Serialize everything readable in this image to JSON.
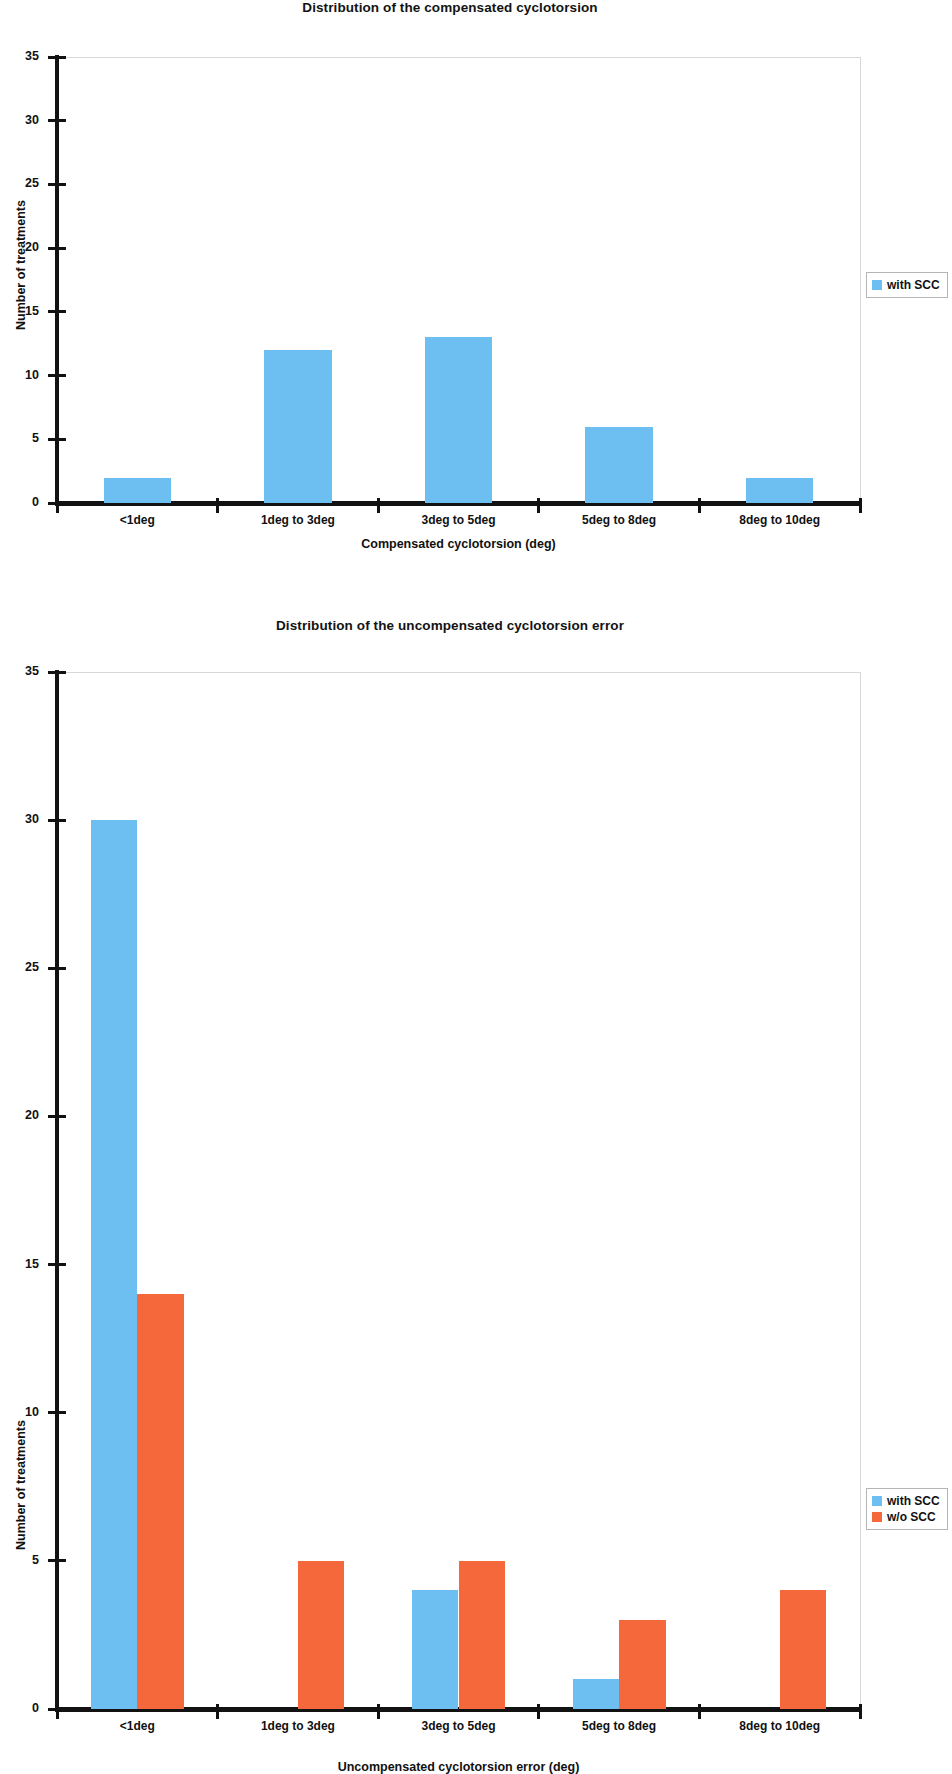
{
  "figures": [
    {
      "id": "compensated",
      "title": "Distribution of the compensated cyclotorsion",
      "xlabel": "Compensated cyclotorsion (deg)",
      "ylabel": "Number of treatments",
      "legend": [
        {
          "label": "with SCC",
          "color": "#6CBFF0"
        }
      ]
    },
    {
      "id": "uncompensated",
      "title": "Distribution of the uncompensated cyclotorsion error",
      "xlabel": "Uncompensated cyclotorsion error (deg)",
      "ylabel": "Number of treatments",
      "legend": [
        {
          "label": "with SCC",
          "color": "#6CBFF0"
        },
        {
          "label": "w/o SCC",
          "color": "#F4683C"
        }
      ]
    }
  ],
  "chart_data": [
    {
      "type": "bar",
      "title": "Distribution of the compensated cyclotorsion",
      "xlabel": "Compensated cyclotorsion (deg)",
      "ylabel": "Number of treatments",
      "categories": [
        "<1deg",
        "1deg to 3deg",
        "3deg to 5deg",
        "5deg to 8deg",
        "8deg to 10deg"
      ],
      "ylim": [
        0,
        35
      ],
      "yticks": [
        0,
        5,
        10,
        15,
        20,
        25,
        30,
        35
      ],
      "grid": false,
      "legend_position": "right",
      "series": [
        {
          "name": "with SCC",
          "color": "#6CBFF0",
          "values": [
            2,
            12,
            13,
            6,
            2
          ]
        }
      ]
    },
    {
      "type": "bar",
      "title": "Distribution of the uncompensated cyclotorsion error",
      "xlabel": "Uncompensated cyclotorsion error (deg)",
      "ylabel": "Number of treatments",
      "categories": [
        "<1deg",
        "1deg to 3deg",
        "3deg to 5deg",
        "5deg to 8deg",
        "8deg to 10deg"
      ],
      "ylim": [
        0,
        35
      ],
      "yticks": [
        0,
        5,
        10,
        15,
        20,
        25,
        30,
        35
      ],
      "grid": false,
      "legend_position": "right",
      "series": [
        {
          "name": "with SCC",
          "color": "#6CBFF0",
          "values": [
            30,
            0,
            4,
            1,
            0
          ]
        },
        {
          "name": "w/o SCC",
          "color": "#F4683C",
          "values": [
            14,
            5,
            5,
            3,
            4
          ]
        }
      ]
    }
  ]
}
